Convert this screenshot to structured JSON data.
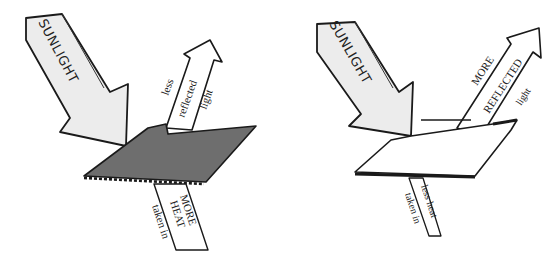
{
  "diagram": {
    "left": {
      "surface": "dark",
      "surface_color": "#6e6e6e",
      "incoming_label": "SUNLIGHT",
      "reflected_label": [
        "less",
        "reflected",
        "light"
      ],
      "absorbed_label": [
        "MORE",
        "HEAT",
        "taken in"
      ]
    },
    "right": {
      "surface": "light",
      "surface_color": "#ffffff",
      "incoming_label": "SUNLIGHT",
      "reflected_label": [
        "MORE",
        "REFLECTED",
        "light"
      ],
      "absorbed_label": [
        "less heat",
        "taken in"
      ]
    },
    "colors": {
      "arrow_fill": "#ececec",
      "outline": "#1a1a1a",
      "background": "#ffffff"
    }
  }
}
